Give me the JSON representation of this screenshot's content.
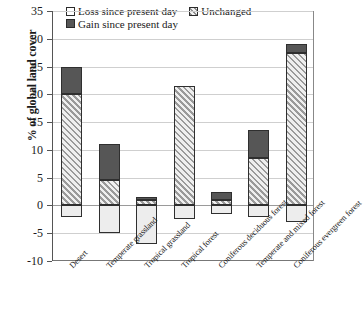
{
  "chart_data": {
    "type": "bar",
    "title": "",
    "xlabel": "",
    "ylabel": "% of global land cover",
    "ylim": [
      -10,
      35
    ],
    "ytick_step": 5,
    "yticks": [
      35,
      30,
      25,
      20,
      15,
      10,
      5,
      0,
      -5,
      -10
    ],
    "grid": true,
    "legend_position": "top-center",
    "stacked": true,
    "categories": [
      "Desert",
      "Temperate grassland",
      "Tropical grassland",
      "Tropical forest",
      "Coniferous deciduous forest",
      "Temperate and mixed forest",
      "Coniferous evergreen forest"
    ],
    "series": [
      {
        "name": "Loss since present day",
        "color": "#ededed",
        "fill": "empty",
        "values": [
          -2.0,
          -5.0,
          -7.0,
          -2.5,
          -1.5,
          -2.0,
          -3.0
        ]
      },
      {
        "name": "Unchanged",
        "color": "#d8d8d8",
        "fill": "hatched",
        "values": [
          20.0,
          4.5,
          1.0,
          21.5,
          1.0,
          8.5,
          27.5
        ]
      },
      {
        "name": "Gain since present day",
        "color": "#565656",
        "fill": "solid",
        "values": [
          5.0,
          6.5,
          0.5,
          0.0,
          1.5,
          5.0,
          1.5
        ]
      }
    ],
    "totals_above_zero": [
      25.0,
      11.0,
      1.5,
      21.5,
      2.5,
      13.5,
      29.0
    ]
  },
  "legend": {
    "items": [
      {
        "label": "Loss since present day",
        "swatch": "loss"
      },
      {
        "label": "Unchanged",
        "swatch": "unchanged"
      },
      {
        "label": "Gain since present day",
        "swatch": "gain"
      }
    ]
  }
}
